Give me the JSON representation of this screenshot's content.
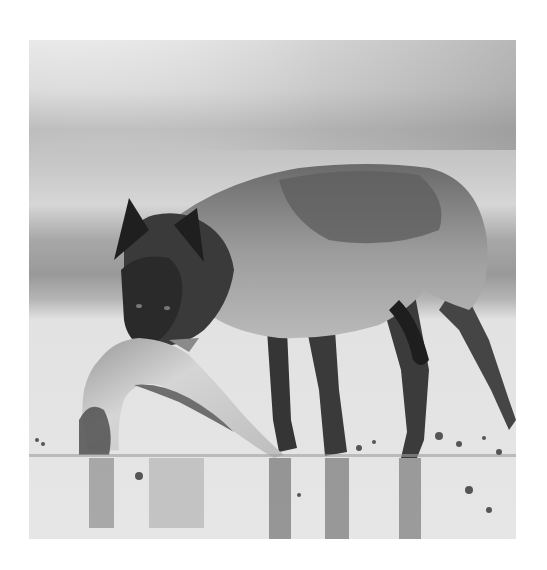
{
  "photo": {
    "subject": "wolf-with-salmon",
    "description": "Black-and-white photograph of a wolf standing in shallow water holding a large salmon in its mouth, with its reflection below and a blurred banded background",
    "colors": {
      "page_background": "#ffffff",
      "sky_light": "#e8e8e8",
      "sky_mid": "#c4c4c4",
      "horizon_dark": "#9a9a9a",
      "water_light": "#e4e4e4",
      "wolf_dark": "#2a2a2a",
      "wolf_mid": "#7a7a7a",
      "wolf_light": "#b8b8b8",
      "fish_light": "#d0d0d0"
    }
  }
}
